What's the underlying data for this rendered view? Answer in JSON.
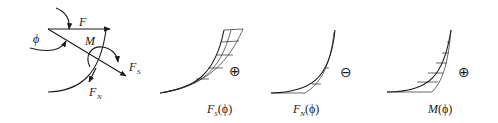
{
  "free_body": {
    "force_label": "F",
    "angle_label": "ϕ",
    "moment_label": "M",
    "shear_label": "F",
    "shear_subscript": "S",
    "normal_label": "F",
    "normal_subscript": "N"
  },
  "plots": [
    {
      "name": "shear",
      "label_main": "F",
      "label_sub": "S",
      "label_arg": "(ϕ)",
      "sign": "⊕",
      "sign_name": "plus"
    },
    {
      "name": "normal",
      "label_main": "F",
      "label_sub": "N",
      "label_arg": "(ϕ)",
      "sign": "⊖",
      "sign_name": "minus"
    },
    {
      "name": "moment",
      "label_main": "M",
      "label_sub": "",
      "label_arg": "(ϕ)",
      "sign": "⊕",
      "sign_name": "plus"
    }
  ]
}
